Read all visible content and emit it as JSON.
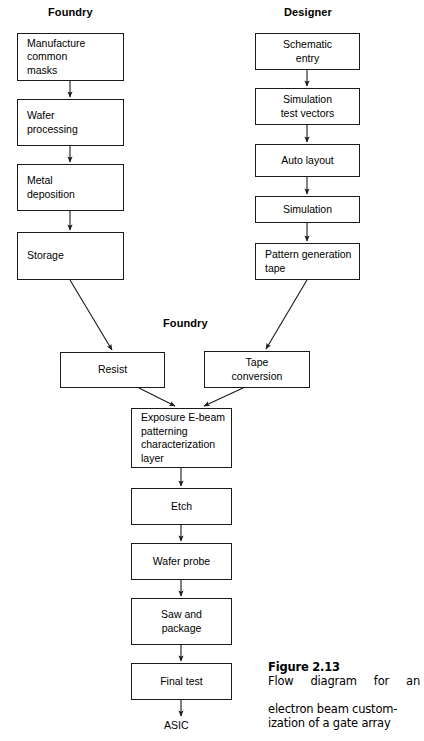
{
  "figure": {
    "number": "Figure 2.13",
    "caption_lines": [
      "Flow  diagram  for  an",
      "electron beam custom-",
      "ization of a gate array"
    ],
    "caption_full": "Flow diagram for an electron beam customization of a gate array"
  },
  "column_headers": [
    {
      "label": "Foundry",
      "x": 48,
      "y": 6
    },
    {
      "label": "Designer",
      "x": 284,
      "y": 6
    },
    {
      "label": "Foundry",
      "x": 163,
      "y": 317
    }
  ],
  "nodes": {
    "manufacture_common_masks": "Manufacture\ncommon\nmasks",
    "wafer_processing": "Wafer\nprocessing",
    "metal_deposition": "Metal\ndeposition",
    "storage": "Storage",
    "schematic_entry": "Schematic\nentry",
    "simulation_test_vectors": "Simulation\ntest vectors",
    "auto_layout": "Auto layout",
    "simulation": "Simulation",
    "pattern_generation_tape": "Pattern generation\ntape",
    "resist": "Resist",
    "tape_conversion": "Tape\nconversion",
    "exposure_ebeam": "Exposure E-beam\npatterning\ncharacterization\nlayer",
    "etch": "Etch",
    "wafer_probe": "Wafer probe",
    "saw_and_package": "Saw and\npackage",
    "final_test": "Final test"
  },
  "terminals": {
    "asic": "ASIC"
  },
  "colors": {
    "stroke": "#1a1a1a",
    "text": "#000000",
    "background": "#ffffff"
  }
}
